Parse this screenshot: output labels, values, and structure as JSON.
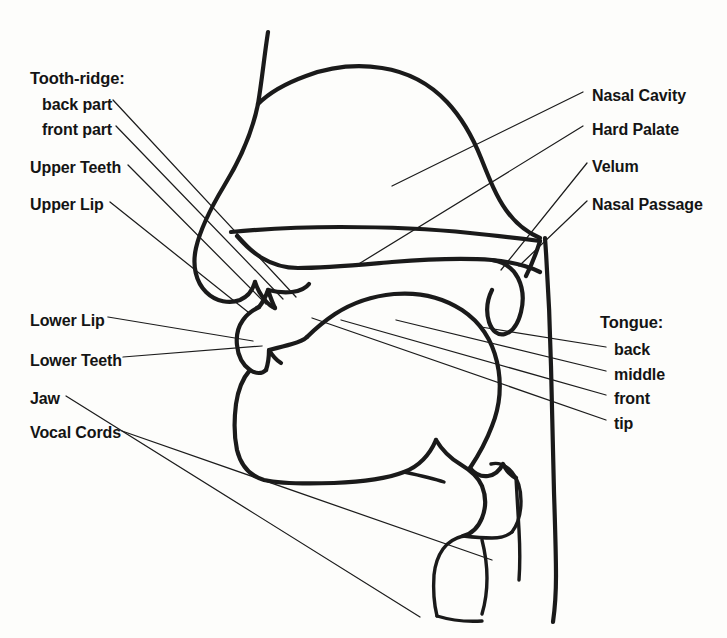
{
  "figure": {
    "background_color": "#fdfdfb",
    "stroke_color": "#1a1a1a",
    "text_color": "#141414",
    "width": 727,
    "height": 638
  },
  "labels_left": [
    {
      "id": "tooth-ridge",
      "text": "Tooth-ridge:",
      "x": 30,
      "y": 70,
      "group_heading": true
    },
    {
      "id": "back-part",
      "text": "back part",
      "x": 42,
      "y": 97,
      "group_heading": false
    },
    {
      "id": "front-part",
      "text": "front part",
      "x": 42,
      "y": 122,
      "group_heading": false
    },
    {
      "id": "upper-teeth",
      "text": "Upper Teeth",
      "x": 30,
      "y": 160,
      "group_heading": false
    },
    {
      "id": "upper-lip",
      "text": "Upper Lip",
      "x": 30,
      "y": 197,
      "group_heading": false
    },
    {
      "id": "lower-lip",
      "text": "Lower Lip",
      "x": 30,
      "y": 313,
      "group_heading": false
    },
    {
      "id": "lower-teeth",
      "text": "Lower Teeth",
      "x": 30,
      "y": 353,
      "group_heading": false
    },
    {
      "id": "jaw",
      "text": "Jaw",
      "x": 30,
      "y": 391,
      "group_heading": false
    },
    {
      "id": "vocal-cords",
      "text": "Vocal Cords",
      "x": 30,
      "y": 425,
      "group_heading": false
    }
  ],
  "labels_right": [
    {
      "id": "nasal-cavity",
      "text": "Nasal Cavity",
      "x": 592,
      "y": 88,
      "group_heading": false
    },
    {
      "id": "hard-palate",
      "text": "Hard Palate",
      "x": 592,
      "y": 122,
      "group_heading": false
    },
    {
      "id": "velum",
      "text": "Velum",
      "x": 592,
      "y": 159,
      "group_heading": false
    },
    {
      "id": "nasal-passage",
      "text": "Nasal Passage",
      "x": 592,
      "y": 197,
      "group_heading": false
    },
    {
      "id": "tongue",
      "text": "Tongue:",
      "x": 600,
      "y": 314,
      "group_heading": true
    },
    {
      "id": "tongue-back",
      "text": "back",
      "x": 614,
      "y": 342,
      "group_heading": false
    },
    {
      "id": "tongue-middle",
      "text": "middle",
      "x": 614,
      "y": 367,
      "group_heading": false
    },
    {
      "id": "tongue-front",
      "text": "front",
      "x": 614,
      "y": 391,
      "group_heading": false
    },
    {
      "id": "tongue-tip",
      "text": "tip",
      "x": 614,
      "y": 416,
      "group_heading": false
    }
  ],
  "leader_lines": [
    {
      "id": "leader-back-part",
      "from": [
        113,
        100
      ],
      "to": [
        296,
        297
      ]
    },
    {
      "id": "leader-front-part",
      "from": [
        116,
        126
      ],
      "to": [
        283,
        299
      ]
    },
    {
      "id": "leader-upper-teeth",
      "from": [
        128,
        165
      ],
      "to": [
        266,
        304
      ]
    },
    {
      "id": "leader-upper-lip",
      "from": [
        110,
        202
      ],
      "to": [
        248,
        312
      ]
    },
    {
      "id": "leader-lower-lip",
      "from": [
        108,
        317
      ],
      "to": [
        253,
        341
      ]
    },
    {
      "id": "leader-lower-teeth",
      "from": [
        123,
        357
      ],
      "to": [
        262,
        346
      ]
    },
    {
      "id": "leader-jaw",
      "from": [
        66,
        396
      ],
      "to": [
        420,
        617
      ]
    },
    {
      "id": "leader-vocal-cords",
      "from": [
        122,
        431
      ],
      "to": [
        492,
        560
      ]
    },
    {
      "id": "leader-nasal-cavity",
      "from": [
        583,
        92
      ],
      "to": [
        392,
        186
      ]
    },
    {
      "id": "leader-hard-palate",
      "from": [
        583,
        126
      ],
      "to": [
        357,
        265
      ]
    },
    {
      "id": "leader-velum",
      "from": [
        587,
        163
      ],
      "to": [
        501,
        270
      ]
    },
    {
      "id": "leader-nasal-passage",
      "from": [
        587,
        201
      ],
      "to": [
        519,
        266
      ]
    },
    {
      "id": "leader-tongue-back",
      "from": [
        606,
        347
      ],
      "to": [
        481,
        327
      ]
    },
    {
      "id": "leader-tongue-middle",
      "from": [
        606,
        371
      ],
      "to": [
        396,
        320
      ]
    },
    {
      "id": "leader-tongue-front",
      "from": [
        606,
        395
      ],
      "to": [
        341,
        320
      ]
    },
    {
      "id": "leader-tongue-tip",
      "from": [
        606,
        420
      ],
      "to": [
        312,
        318
      ]
    }
  ],
  "anatomy_paths": [
    {
      "id": "nose-bridge-profile",
      "d": "M 268 32 C 264 58, 262 80, 258 104 C 252 134, 240 160, 224 186 C 212 206, 201 226, 196 248 C 192 266, 196 282, 206 292 C 216 302, 230 304, 240 300 C 249 296, 253 289, 255 282"
    },
    {
      "id": "upper-lip-outer",
      "d": "M 255 282 C 257 288, 260 294, 264 299 C 268 304, 272 307, 275 308"
    },
    {
      "id": "philtrum-to-lipedge",
      "d": "M 275 308 C 272 302, 270 296, 268 290 C 266 296, 263 302, 259 307"
    },
    {
      "id": "upper-teeth-gumline",
      "d": "M 268 290 C 276 292, 284 293, 292 292 C 300 291, 306 288, 309 284"
    },
    {
      "id": "nasal-cavity-dome",
      "d": "M 258 104 C 268 94, 284 84, 306 76 C 330 67, 356 64, 382 68 C 408 72, 430 84, 447 102 C 462 118, 473 138, 481 158 C 489 178, 496 196, 506 210 C 516 224, 528 233, 540 238"
    },
    {
      "id": "hard-palate-upper-line",
      "d": "M 231 232 C 262 229, 300 227, 340 227 C 386 227, 432 229, 470 233 C 500 236, 524 239, 540 241"
    },
    {
      "id": "hard-palate-lower-line",
      "d": "M 237 236 C 244 244, 252 252, 262 258 C 272 264, 284 268, 298 268 C 324 268, 356 265, 392 262 C 430 259, 466 258, 492 260 C 512 262, 528 266, 540 272"
    },
    {
      "id": "velum-soft-palate",
      "d": "M 492 260 C 504 262, 513 268, 518 278 C 523 288, 524 300, 521 312 C 518 324, 512 332, 505 334 C 498 336, 492 331, 489 322 C 486 312, 487 300, 492 290"
    },
    {
      "id": "pharynx-back-wall",
      "d": "M 545 238 C 548 280, 550 322, 551 366 C 552 410, 553 452, 554 492 C 555 524, 556 552, 556 576"
    },
    {
      "id": "nasal-passage-channel",
      "d": "M 540 241 C 536 254, 531 266, 526 276"
    },
    {
      "id": "lower-lip-outer",
      "d": "M 259 307 C 253 310, 247 314, 243 320 C 238 327, 236 336, 237 345 C 238 356, 243 365, 250 370 C 256 374, 262 374, 266 370"
    },
    {
      "id": "lower-lip-inner",
      "d": "M 266 370 C 268 364, 269 357, 269 350 C 272 355, 276 360, 281 363"
    },
    {
      "id": "lower-teeth-gumline",
      "d": "M 269 350 C 277 348, 285 346, 292 344 C 299 342, 304 340, 307 337"
    },
    {
      "id": "jaw-chin-profile",
      "d": "M 250 370 C 243 378, 238 390, 236 404 C 234 420, 234 436, 237 450 C 241 466, 250 476, 264 480 C 282 484, 306 484, 334 483 C 362 482, 386 479, 404 472 C 420 466, 430 454, 436 440"
    },
    {
      "id": "tongue-body",
      "d": "M 307 337 C 314 330, 323 322, 335 314 C 352 303, 372 296, 394 294 C 418 292, 442 297, 462 310 C 480 322, 492 340, 497 362 C 502 384, 500 406, 492 426 C 486 442, 478 456, 470 468"
    },
    {
      "id": "tongue-root-to-epiglottis",
      "d": "M 470 468 C 475 474, 481 477, 488 476 C 495 475, 500 470, 503 464 C 506 470, 510 475, 516 478"
    },
    {
      "id": "epiglottis",
      "d": "M 436 440 C 442 450, 450 458, 460 464 C 470 470, 478 476, 482 486 C 486 496, 486 508, 482 518 C 478 528, 471 534, 463 536"
    },
    {
      "id": "larynx-front-wall",
      "d": "M 463 536 C 455 538, 448 542, 443 549 C 438 556, 435 565, 434 575 C 433 590, 434 604, 437 616"
    },
    {
      "id": "vocal-cords-fold",
      "d": "M 463 536 C 472 537, 482 538, 492 538 C 500 538, 507 536, 512 532"
    },
    {
      "id": "laryngeal-ventricle",
      "d": "M 512 532 C 518 524, 521 513, 521 501 C 521 489, 518 479, 512 472 C 506 465, 498 462, 491 464"
    },
    {
      "id": "trachea-back",
      "d": "M 516 478 C 517 496, 518 514, 519 530 C 520 548, 520 566, 519 580"
    },
    {
      "id": "trachea-front-lower",
      "d": "M 482 540 C 485 552, 487 565, 487 578 C 487 592, 485 604, 482 614"
    },
    {
      "id": "hyoid-underline",
      "d": "M 404 472 C 418 475, 432 478, 444 482"
    },
    {
      "id": "neck-front-lower",
      "d": "M 437 616 C 450 620, 466 622, 482 621"
    },
    {
      "id": "pharynx-lower-back",
      "d": "M 556 576 C 556 592, 555 608, 553 622"
    }
  ]
}
